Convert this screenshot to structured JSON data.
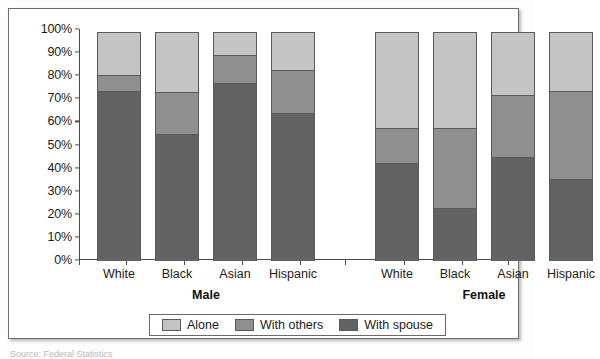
{
  "chart_data": {
    "type": "bar",
    "subtype": "stacked-bar-100-percent",
    "title": "",
    "xlabel": "",
    "ylabel": "",
    "ylim": [
      0,
      100
    ],
    "ytick_labels": [
      "0%",
      "10%",
      "20%",
      "30%",
      "40%",
      "50%",
      "60%",
      "70%",
      "80%",
      "90%",
      "100%"
    ],
    "ytick_values": [
      0,
      10,
      20,
      30,
      40,
      50,
      60,
      70,
      80,
      90,
      100
    ],
    "grid": false,
    "legend_position": "bottom-center",
    "groups": [
      "Male",
      "Female"
    ],
    "categories": [
      "White",
      "Black",
      "Asian",
      "Hispanic"
    ],
    "series": [
      {
        "name": "With spouse",
        "color": "#636363",
        "values": {
          "Male": [
            73.5,
            55,
            77,
            64
          ],
          "Female": [
            42.5,
            23,
            45,
            35.5
          ]
        }
      },
      {
        "name": "With others",
        "color": "#8f8f8f",
        "values": {
          "Male": [
            7.5,
            18.5,
            12.5,
            19
          ],
          "Female": [
            15.5,
            35,
            27.5,
            38.5
          ]
        }
      },
      {
        "name": "Alone",
        "color": "#c4c4c4",
        "values": {
          "Male": [
            19,
            26.5,
            10.5,
            17
          ],
          "Female": [
            42,
            42,
            27.5,
            26
          ]
        }
      }
    ],
    "bars": [
      {
        "group": "Male",
        "category": "White",
        "spouse": 73.5,
        "others": 7.5,
        "alone": 19.0,
        "total": 100
      },
      {
        "group": "Male",
        "category": "Black",
        "spouse": 55.0,
        "others": 18.5,
        "alone": 26.5,
        "total": 100
      },
      {
        "group": "Male",
        "category": "Asian",
        "spouse": 77.0,
        "others": 12.5,
        "alone": 10.5,
        "total": 100
      },
      {
        "group": "Male",
        "category": "Hispanic",
        "spouse": 64.0,
        "others": 19.0,
        "alone": 17.0,
        "total": 100
      },
      {
        "group": "Female",
        "category": "White",
        "spouse": 42.5,
        "others": 15.5,
        "alone": 42.0,
        "total": 100
      },
      {
        "group": "Female",
        "category": "Black",
        "spouse": 23.0,
        "others": 35.0,
        "alone": 42.0,
        "total": 100
      },
      {
        "group": "Female",
        "category": "Asian",
        "spouse": 45.0,
        "others": 27.5,
        "alone": 27.5,
        "total": 100
      },
      {
        "group": "Female",
        "category": "Hispanic",
        "spouse": 35.5,
        "others": 38.5,
        "alone": 26.0,
        "total": 100
      }
    ]
  },
  "legend": {
    "items": [
      {
        "label": "Alone",
        "key": "alone"
      },
      {
        "label": "With others",
        "key": "others"
      },
      {
        "label": "With spouse",
        "key": "spouse"
      }
    ]
  },
  "labels": {
    "male_group": "Male",
    "female_group": "Female",
    "cat_white": "White",
    "cat_black": "Black",
    "cat_asian": "Asian",
    "cat_hispanic": "Hispanic"
  },
  "yticks": [
    {
      "label": "100%",
      "value": 100
    },
    {
      "label": "90%",
      "value": 90
    },
    {
      "label": "80%",
      "value": 80
    },
    {
      "label": "70%",
      "value": 70
    },
    {
      "label": "60%",
      "value": 60
    },
    {
      "label": "50%",
      "value": 50
    },
    {
      "label": "40%",
      "value": 40
    },
    {
      "label": "30%",
      "value": 30
    },
    {
      "label": "20%",
      "value": 20
    },
    {
      "label": "10%",
      "value": 10
    },
    {
      "label": "0%",
      "value": 0
    }
  ],
  "colors": {
    "alone": "#c4c4c4",
    "others": "#8f8f8f",
    "spouse": "#636363",
    "axis": "#4a4a4a",
    "text": "#1b1b1b"
  },
  "source_caption": "Source: Federal Statistics"
}
